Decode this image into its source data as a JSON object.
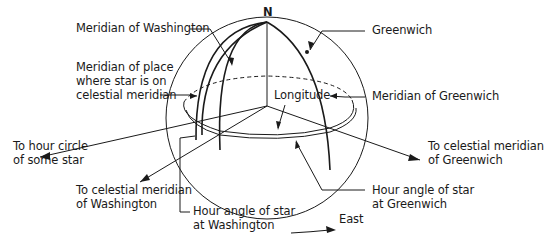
{
  "diagram": {
    "type": "celestial-sphere",
    "pole_label": "N",
    "labels": {
      "meridian_washington": "Meridian of Washington",
      "meridian_place_line1": "Meridian of place",
      "meridian_place_line2": "where star is on",
      "meridian_place_line3": "celestial meridian",
      "greenwich": "Greenwich",
      "longitude": "Longitude",
      "meridian_greenwich": "Meridian of Greenwich",
      "hour_circle_line1": "To hour circle",
      "hour_circle_line2": "of some star",
      "celestial_meridian_greenwich_line1": "To celestial meridian",
      "celestial_meridian_greenwich_line2": "of Greenwich",
      "celestial_meridian_washington_line1": "To celestial meridian",
      "celestial_meridian_washington_line2": "of Washington",
      "hour_angle_greenwich_line1": "Hour angle of star",
      "hour_angle_greenwich_line2": "at Greenwich",
      "hour_angle_washington_line1": "Hour angle of star",
      "hour_angle_washington_line2": "at Washington",
      "east": "East"
    },
    "colors": {
      "ink": "#1a1a1a",
      "background": "#ffffff"
    }
  }
}
